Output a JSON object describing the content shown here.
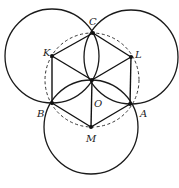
{
  "diagram": {
    "points": {
      "O": {
        "label": "O",
        "x": 92,
        "y": 80
      },
      "C": {
        "label": "C",
        "x": 93,
        "y": 33
      },
      "K": {
        "label": "K",
        "x": 52,
        "y": 56
      },
      "L": {
        "label": "L",
        "x": 131,
        "y": 57
      },
      "B": {
        "label": "B",
        "x": 52,
        "y": 103
      },
      "A": {
        "label": "A",
        "x": 130,
        "y": 104
      },
      "M": {
        "label": "M",
        "x": 91,
        "y": 127
      }
    },
    "circles": [
      {
        "center": "K",
        "radius": 47,
        "style": "solid"
      },
      {
        "center": "L",
        "radius": 47,
        "style": "solid"
      },
      {
        "center": "M",
        "radius": 47,
        "style": "solid"
      },
      {
        "center": "O",
        "radius": 47,
        "style": "dashed"
      }
    ],
    "segments": [
      [
        "C",
        "L"
      ],
      [
        "L",
        "A"
      ],
      [
        "A",
        "M"
      ],
      [
        "M",
        "B"
      ],
      [
        "B",
        "K"
      ],
      [
        "K",
        "C"
      ],
      [
        "K",
        "O"
      ],
      [
        "L",
        "O"
      ],
      [
        "M",
        "O"
      ]
    ],
    "colors": {
      "stroke": "#111111",
      "background": "#ffffff"
    }
  }
}
